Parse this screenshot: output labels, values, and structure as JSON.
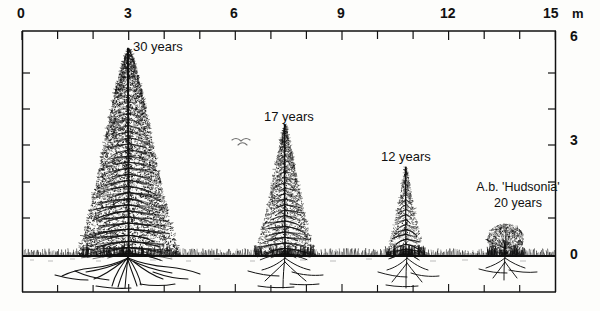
{
  "figure": {
    "kind": "scale-diagram",
    "ink_color": "#111111",
    "paper_color": "#fdfdfb"
  },
  "horizontal_axis": {
    "unit": "m",
    "unit_label": "m",
    "min": 0,
    "max": 15,
    "major_step": 3,
    "minor_step": 0.5,
    "labels": [
      "0",
      "3",
      "6",
      "9",
      "12",
      "15"
    ],
    "label_values": [
      0,
      3,
      6,
      9,
      12,
      15
    ]
  },
  "vertical_axis": {
    "unit": "m",
    "min": 0,
    "max": 6,
    "major_step": 3,
    "minor_step": 0.5,
    "labels": [
      "6",
      "3",
      "0"
    ],
    "label_values": [
      6,
      3,
      0
    ]
  },
  "specimens": [
    {
      "id": "tree-30-years",
      "label": "30 years",
      "age_years": 30,
      "caption_lines": [
        "30 years"
      ],
      "x_m": 3.0,
      "height_m": 5.6,
      "crown_width_m": 2.9,
      "form": "large-conifer"
    },
    {
      "id": "tree-17-years",
      "label": "17 years",
      "age_years": 17,
      "caption_lines": [
        "17 years"
      ],
      "x_m": 7.4,
      "height_m": 3.55,
      "crown_width_m": 1.75,
      "form": "medium-conifer"
    },
    {
      "id": "tree-12-years",
      "label": "12 years",
      "age_years": 12,
      "caption_lines": [
        "12 years"
      ],
      "x_m": 10.8,
      "height_m": 2.4,
      "crown_width_m": 1.15,
      "form": "small-conifer"
    },
    {
      "id": "shrub-hudsonia-20-years",
      "label": "A.b. 'Hudsonia' 20 years",
      "age_years": 20,
      "caption_lines": [
        "A.b. 'Hudsonia'",
        "20 years"
      ],
      "x_m": 13.6,
      "height_m": 0.82,
      "crown_width_m": 1.1,
      "form": "dwarf-cushion-shrub"
    }
  ],
  "scene": {
    "ground_label": "ground line",
    "ground_level_m": 0,
    "bird_label": "flying bird silhouette",
    "roots_label": "root systems"
  }
}
